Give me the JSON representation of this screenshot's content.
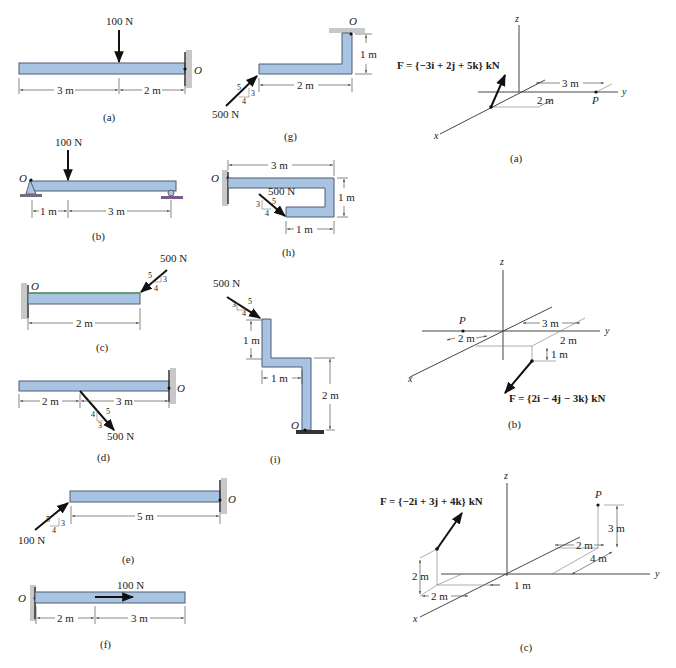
{
  "page": {
    "colors": {
      "beam_fill": "#a9c3e3",
      "beam_stroke": "#4b5c72",
      "ink": "#222222",
      "support": "#c8c8c8"
    }
  },
  "left_figures": [
    {
      "id": "a",
      "caption": "(a)",
      "force": "100 N",
      "point": "O",
      "dims": [
        "3 m",
        "2 m"
      ]
    },
    {
      "id": "b",
      "caption": "(b)",
      "force": "100 N",
      "point": "O",
      "dims": [
        "1 m",
        "3 m"
      ]
    },
    {
      "id": "c",
      "caption": "(c)",
      "force": "500 N",
      "point": "O",
      "dims": [
        "2 m"
      ],
      "slope": [
        "5",
        "3",
        "4"
      ]
    },
    {
      "id": "d",
      "caption": "(d)",
      "force": "500 N",
      "point": "O",
      "dims": [
        "2 m",
        "3 m"
      ],
      "slope": [
        "5",
        "4",
        "3"
      ]
    },
    {
      "id": "e",
      "caption": "(e)",
      "force": "100 N",
      "point": "O",
      "dims": [
        "5 m"
      ],
      "slope": [
        "5",
        "3",
        "4"
      ]
    },
    {
      "id": "f",
      "caption": "(f)",
      "force": "100 N",
      "point": "O",
      "dims": [
        "2 m",
        "3 m"
      ]
    }
  ],
  "middle_figures": [
    {
      "id": "g",
      "caption": "(g)",
      "force": "500 N",
      "point": "O",
      "dims": [
        "2 m",
        "1 m"
      ],
      "slope": [
        "5",
        "3",
        "4"
      ]
    },
    {
      "id": "h",
      "caption": "(h)",
      "force": "500 N",
      "point": "O",
      "dims": [
        "3 m",
        "1 m",
        "1 m"
      ],
      "slope": [
        "5",
        "3",
        "4"
      ]
    },
    {
      "id": "i",
      "caption": "(i)",
      "force": "500 N",
      "point": "O",
      "dims": [
        "1 m",
        "1 m",
        "2 m"
      ],
      "slope": [
        "5",
        "3",
        "4"
      ]
    }
  ],
  "right_figures": [
    {
      "id": "a",
      "caption": "(a)",
      "force_label": "F = {−3i + 2j + 5k} kN",
      "point": "P",
      "axes": [
        "x",
        "y",
        "z"
      ],
      "dims": [
        "3 m",
        "2 m"
      ]
    },
    {
      "id": "b",
      "caption": "(b)",
      "force_label": "F = {2i − 4j − 3k} kN",
      "point": "P",
      "axes": [
        "x",
        "y",
        "z"
      ],
      "dims": [
        "3 m",
        "2 m",
        "2 m",
        "1 m"
      ]
    },
    {
      "id": "c",
      "caption": "(c)",
      "force_label": "F = {−2i + 3j + 4k} kN",
      "point": "P",
      "axes": [
        "x",
        "y",
        "z"
      ],
      "dims": [
        "2 m",
        "2 m",
        "1 m",
        "2 m",
        "4 m",
        "3 m"
      ]
    }
  ]
}
